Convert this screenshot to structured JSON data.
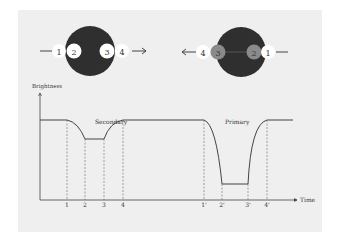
{
  "diagram": {
    "colors": {
      "panel_bg": "#efefef",
      "star_dark": "#2f2f2f",
      "star_gray": "#8a8a8a",
      "small_white": "#ffffff",
      "line": "#555555"
    },
    "left_star": {
      "labels": [
        "1",
        "2",
        "3",
        "4"
      ],
      "direction": "right"
    },
    "right_star": {
      "labels": [
        "4",
        "3",
        "2",
        "1"
      ],
      "direction": "left"
    },
    "graph": {
      "y_label": "Brightness",
      "x_label": "Time",
      "secondary_label": "Secondary",
      "primary_label": "Primary",
      "ticks": [
        "1",
        "2",
        "3",
        "4",
        "1'",
        "2'",
        "3'",
        "4'"
      ]
    }
  }
}
